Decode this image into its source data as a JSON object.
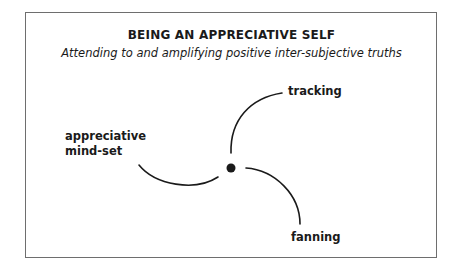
{
  "diagram": {
    "title": "BEING AN APPRECIATIVE SELF",
    "subtitle": "Attending to and amplifying positive inter-subjective truths",
    "center_node": "self-dot",
    "branches": [
      {
        "label_line1": "tracking",
        "label_line2": ""
      },
      {
        "label_line1": "appreciative",
        "label_line2": "mind-set"
      },
      {
        "label_line1": "fanning",
        "label_line2": ""
      }
    ],
    "colors": {
      "stroke": "#1a1a1a",
      "frame": "#6e6e6e",
      "background": "#ffffff"
    }
  }
}
